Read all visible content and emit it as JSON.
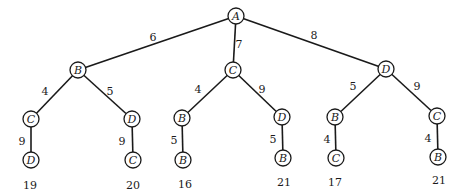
{
  "diagram": {
    "type": "weighted-tree",
    "root": "n0",
    "nodes": [
      {
        "id": "n0",
        "label": "A",
        "x": 236,
        "y": 16
      },
      {
        "id": "n1",
        "label": "B",
        "x": 78,
        "y": 70
      },
      {
        "id": "n2",
        "label": "C",
        "x": 233,
        "y": 70
      },
      {
        "id": "n3",
        "label": "D",
        "x": 386,
        "y": 69
      },
      {
        "id": "n4",
        "label": "C",
        "x": 31,
        "y": 119
      },
      {
        "id": "n5",
        "label": "D",
        "x": 132,
        "y": 119
      },
      {
        "id": "n6",
        "label": "B",
        "x": 182,
        "y": 118
      },
      {
        "id": "n7",
        "label": "D",
        "x": 282,
        "y": 117
      },
      {
        "id": "n8",
        "label": "B",
        "x": 335,
        "y": 117
      },
      {
        "id": "n9",
        "label": "C",
        "x": 437,
        "y": 116
      },
      {
        "id": "n10",
        "label": "D",
        "x": 31,
        "y": 160
      },
      {
        "id": "n11",
        "label": "C",
        "x": 133,
        "y": 160
      },
      {
        "id": "n12",
        "label": "B",
        "x": 183,
        "y": 160
      },
      {
        "id": "n13",
        "label": "B",
        "x": 283,
        "y": 158
      },
      {
        "id": "n14",
        "label": "C",
        "x": 336,
        "y": 158
      },
      {
        "id": "n15",
        "label": "B",
        "x": 438,
        "y": 157
      }
    ],
    "edges": [
      {
        "from": "n0",
        "to": "n1",
        "weight": "6",
        "lx": 153,
        "ly": 38
      },
      {
        "from": "n0",
        "to": "n2",
        "weight": "7",
        "lx": 239,
        "ly": 45
      },
      {
        "from": "n0",
        "to": "n3",
        "weight": "8",
        "lx": 314,
        "ly": 36
      },
      {
        "from": "n1",
        "to": "n4",
        "weight": "4",
        "lx": 45,
        "ly": 92
      },
      {
        "from": "n1",
        "to": "n5",
        "weight": "5",
        "lx": 110,
        "ly": 92
      },
      {
        "from": "n2",
        "to": "n6",
        "weight": "4",
        "lx": 198,
        "ly": 90
      },
      {
        "from": "n2",
        "to": "n7",
        "weight": "9",
        "lx": 262,
        "ly": 90
      },
      {
        "from": "n3",
        "to": "n8",
        "weight": "5",
        "lx": 353,
        "ly": 87
      },
      {
        "from": "n3",
        "to": "n9",
        "weight": "9",
        "lx": 417,
        "ly": 87
      },
      {
        "from": "n4",
        "to": "n10",
        "weight": "9",
        "lx": 22,
        "ly": 142
      },
      {
        "from": "n5",
        "to": "n11",
        "weight": "9",
        "lx": 122,
        "ly": 142
      },
      {
        "from": "n6",
        "to": "n12",
        "weight": "5",
        "lx": 174,
        "ly": 141
      },
      {
        "from": "n7",
        "to": "n13",
        "weight": "5",
        "lx": 273,
        "ly": 140
      },
      {
        "from": "n8",
        "to": "n14",
        "weight": "4",
        "lx": 327,
        "ly": 140
      },
      {
        "from": "n9",
        "to": "n15",
        "weight": "4",
        "lx": 428,
        "ly": 139
      }
    ],
    "path_totals": [
      {
        "leaf": "n10",
        "value": "19",
        "x": 30,
        "y": 186
      },
      {
        "leaf": "n11",
        "value": "20",
        "x": 133,
        "y": 186
      },
      {
        "leaf": "n12",
        "value": "16",
        "x": 185,
        "y": 185
      },
      {
        "leaf": "n13",
        "value": "21",
        "x": 284,
        "y": 183
      },
      {
        "leaf": "n14",
        "value": "17",
        "x": 335,
        "y": 183
      },
      {
        "leaf": "n15",
        "value": "21",
        "x": 439,
        "y": 181
      }
    ],
    "node_radius": 8,
    "colors": {
      "stroke": "#1a1a1a",
      "background": "#ffffff"
    }
  }
}
